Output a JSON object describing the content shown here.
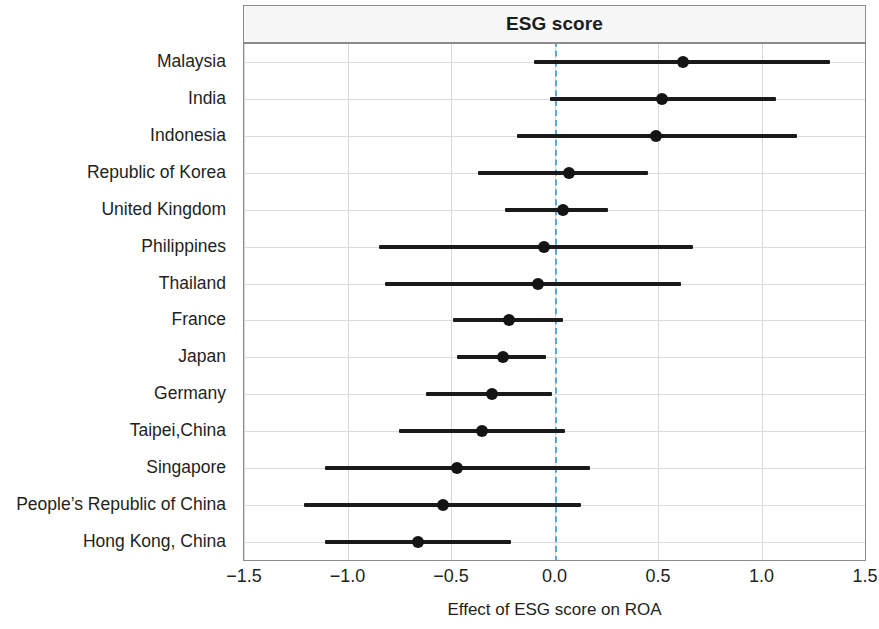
{
  "chart_data": {
    "type": "scatter",
    "subtype": "forest-plot",
    "title": "ESG score",
    "xlabel": "Effect of ESG score on ROA",
    "ylabel": "",
    "xlim": [
      -1.5,
      1.5
    ],
    "xticks": [
      "-1.5",
      "-1.0",
      "-0.5",
      "0.0",
      "0.5",
      "1.0",
      "1.5"
    ],
    "xtick_values": [
      -1.5,
      -1.0,
      -0.5,
      0.0,
      0.5,
      1.0,
      1.5
    ],
    "grid": true,
    "legend": "none",
    "reference_line": {
      "value": 0.0,
      "style": "dashed",
      "color": "#5aa8d8"
    },
    "colors": {
      "point": "#141414",
      "interval": "#1a1a1a",
      "grid": "#dcdcdc",
      "frame": "#8c8c8c",
      "title_bg": "#f7f7f7"
    },
    "categories": [
      "Malaysia",
      "India",
      "Indonesia",
      "Republic of Korea",
      "United Kingdom",
      "Philippines",
      "Thailand",
      "France",
      "Japan",
      "Germany",
      "Taipei,China",
      "Singapore",
      "People’s Republic of China",
      "Hong Kong, China"
    ],
    "points": [
      {
        "label": "Malaysia",
        "estimate": 0.62,
        "ci_low": -0.1,
        "ci_high": 1.33
      },
      {
        "label": "India",
        "estimate": 0.52,
        "ci_low": -0.02,
        "ci_high": 1.07
      },
      {
        "label": "Indonesia",
        "estimate": 0.49,
        "ci_low": -0.18,
        "ci_high": 1.17
      },
      {
        "label": "Republic of Korea",
        "estimate": 0.07,
        "ci_low": -0.37,
        "ci_high": 0.45
      },
      {
        "label": "United Kingdom",
        "estimate": 0.04,
        "ci_low": -0.24,
        "ci_high": 0.26
      },
      {
        "label": "Philippines",
        "estimate": -0.05,
        "ci_low": -0.85,
        "ci_high": 0.67
      },
      {
        "label": "Thailand",
        "estimate": -0.08,
        "ci_low": -0.82,
        "ci_high": 0.61
      },
      {
        "label": "France",
        "estimate": -0.22,
        "ci_low": -0.49,
        "ci_high": 0.04
      },
      {
        "label": "Japan",
        "estimate": -0.25,
        "ci_low": -0.47,
        "ci_high": -0.04
      },
      {
        "label": "Germany",
        "estimate": -0.3,
        "ci_low": -0.62,
        "ci_high": -0.01
      },
      {
        "label": "Taipei,China",
        "estimate": -0.35,
        "ci_low": -0.75,
        "ci_high": 0.05
      },
      {
        "label": "Singapore",
        "estimate": -0.47,
        "ci_low": -1.11,
        "ci_high": 0.17
      },
      {
        "label": "People’s Republic of China",
        "estimate": -0.54,
        "ci_low": -1.21,
        "ci_high": 0.13
      },
      {
        "label": "Hong Kong, China",
        "estimate": -0.66,
        "ci_low": -1.11,
        "ci_high": -0.21
      }
    ]
  }
}
